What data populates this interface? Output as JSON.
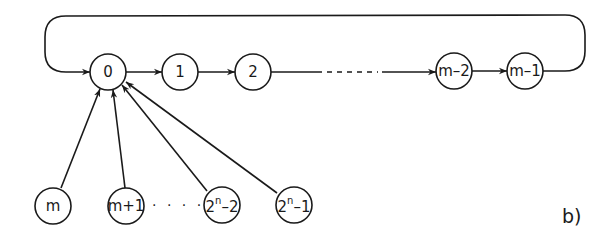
{
  "diagram": {
    "panel_label": "b)",
    "ring_nodes": [
      {
        "id": "0",
        "label": "0"
      },
      {
        "id": "1",
        "label": "1"
      },
      {
        "id": "2",
        "label": "2"
      },
      {
        "id": "m-2",
        "label": "m–2"
      },
      {
        "id": "m-1",
        "label": "m–1"
      }
    ],
    "tail_nodes": [
      {
        "id": "m",
        "label": "m"
      },
      {
        "id": "m+1",
        "label": "m+1"
      },
      {
        "id": "2^n-2",
        "base": "2",
        "sup": "n",
        "rest": "–2"
      },
      {
        "id": "2^n-1",
        "base": "2",
        "sup": "n",
        "rest": "–1"
      }
    ],
    "tail_ellipsis": "· · · ·",
    "edges": [
      {
        "from": "0",
        "to": "1"
      },
      {
        "from": "1",
        "to": "2"
      },
      {
        "from": "2",
        "to": "m-2",
        "style": "partly-dashed"
      },
      {
        "from": "m-2",
        "to": "m-1"
      },
      {
        "from": "m-1",
        "to": "0",
        "style": "feedback-loop"
      },
      {
        "from": "m",
        "to": "0"
      },
      {
        "from": "m+1",
        "to": "0"
      },
      {
        "from": "2^n-2",
        "to": "0"
      },
      {
        "from": "2^n-1",
        "to": "0"
      }
    ]
  }
}
